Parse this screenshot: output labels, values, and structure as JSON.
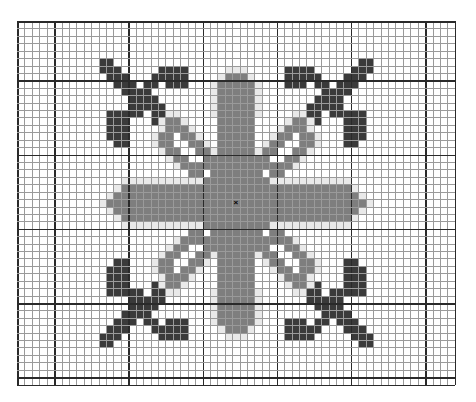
{
  "chart": {
    "cols": 59,
    "rows": 49,
    "cell_px": 7.42,
    "major_every": 10,
    "major_offset_col": 5,
    "major_offset_row": 8,
    "center": {
      "col": 29,
      "row": 24,
      "symbol": "×"
    },
    "colors": {
      "dark": "#3a3a3a",
      "medium": "#7e7e7e",
      "pale": "#e9e9e9",
      "background": "#ffffff",
      "minor_line": "#9a9a9a",
      "major_line": "#2a2a2a"
    },
    "legend": [
      {
        "key": "dark",
        "label": "Dark stitch"
      },
      {
        "key": "medium",
        "label": "Medium stitch"
      },
      {
        "key": "pale",
        "label": "Pale outline stitch"
      }
    ],
    "quadrant_top_left": {
      "dark": [
        [
          5,
          11
        ],
        [
          5,
          12
        ],
        [
          6,
          11
        ],
        [
          6,
          12
        ],
        [
          6,
          13
        ],
        [
          6,
          19
        ],
        [
          6,
          20
        ],
        [
          6,
          21
        ],
        [
          6,
          22
        ],
        [
          7,
          12
        ],
        [
          7,
          13
        ],
        [
          7,
          14
        ],
        [
          7,
          18
        ],
        [
          7,
          19
        ],
        [
          7,
          20
        ],
        [
          7,
          21
        ],
        [
          7,
          22
        ],
        [
          8,
          13
        ],
        [
          8,
          14
        ],
        [
          8,
          15
        ],
        [
          8,
          17
        ],
        [
          8,
          18
        ],
        [
          8,
          20
        ],
        [
          8,
          21
        ],
        [
          8,
          22
        ],
        [
          9,
          14
        ],
        [
          9,
          15
        ],
        [
          9,
          16
        ],
        [
          9,
          17
        ],
        [
          10,
          15
        ],
        [
          10,
          16
        ],
        [
          10,
          17
        ],
        [
          10,
          18
        ],
        [
          11,
          15
        ],
        [
          11,
          16
        ],
        [
          11,
          17
        ],
        [
          11,
          18
        ],
        [
          11,
          19
        ],
        [
          12,
          12
        ],
        [
          12,
          13
        ],
        [
          12,
          14
        ],
        [
          12,
          15
        ],
        [
          12,
          16
        ],
        [
          12,
          18
        ],
        [
          12,
          19
        ],
        [
          13,
          12
        ],
        [
          13,
          13
        ],
        [
          13,
          14
        ],
        [
          13,
          18
        ],
        [
          14,
          12
        ],
        [
          14,
          13
        ],
        [
          14,
          14
        ],
        [
          15,
          12
        ],
        [
          15,
          13
        ],
        [
          15,
          14
        ],
        [
          16,
          13
        ],
        [
          16,
          14
        ]
      ],
      "medium": [
        [
          7,
          28
        ],
        [
          7,
          29
        ],
        [
          8,
          27
        ],
        [
          8,
          28
        ],
        [
          8,
          29
        ],
        [
          9,
          27
        ],
        [
          9,
          28
        ],
        [
          9,
          29
        ],
        [
          10,
          27
        ],
        [
          10,
          28
        ],
        [
          10,
          29
        ],
        [
          11,
          27
        ],
        [
          11,
          28
        ],
        [
          11,
          29
        ],
        [
          12,
          27
        ],
        [
          12,
          28
        ],
        [
          12,
          29
        ],
        [
          13,
          20
        ],
        [
          13,
          21
        ],
        [
          13,
          27
        ],
        [
          13,
          28
        ],
        [
          13,
          29
        ],
        [
          14,
          20
        ],
        [
          14,
          21
        ],
        [
          14,
          22
        ],
        [
          14,
          27
        ],
        [
          14,
          28
        ],
        [
          14,
          29
        ],
        [
          15,
          19
        ],
        [
          15,
          20
        ],
        [
          15,
          22
        ],
        [
          15,
          23
        ],
        [
          15,
          27
        ],
        [
          15,
          28
        ],
        [
          15,
          29
        ],
        [
          16,
          19
        ],
        [
          16,
          20
        ],
        [
          16,
          23
        ],
        [
          16,
          24
        ],
        [
          16,
          27
        ],
        [
          16,
          28
        ],
        [
          16,
          29
        ],
        [
          17,
          20
        ],
        [
          17,
          21
        ],
        [
          17,
          24
        ],
        [
          17,
          25
        ],
        [
          17,
          27
        ],
        [
          17,
          28
        ],
        [
          17,
          29
        ],
        [
          18,
          21
        ],
        [
          18,
          22
        ],
        [
          18,
          25
        ],
        [
          18,
          26
        ],
        [
          18,
          27
        ],
        [
          18,
          28
        ],
        [
          18,
          29
        ],
        [
          19,
          22
        ],
        [
          19,
          23
        ],
        [
          19,
          24
        ],
        [
          19,
          25
        ],
        [
          19,
          26
        ],
        [
          19,
          27
        ],
        [
          19,
          28
        ],
        [
          19,
          29
        ],
        [
          20,
          23
        ],
        [
          20,
          24
        ],
        [
          20,
          26
        ],
        [
          20,
          27
        ],
        [
          20,
          28
        ],
        [
          20,
          29
        ],
        [
          21,
          25
        ],
        [
          21,
          26
        ],
        [
          21,
          27
        ],
        [
          21,
          28
        ],
        [
          21,
          29
        ],
        [
          22,
          14
        ],
        [
          22,
          15
        ],
        [
          22,
          16
        ],
        [
          22,
          17
        ],
        [
          22,
          18
        ],
        [
          22,
          19
        ],
        [
          22,
          20
        ],
        [
          22,
          21
        ],
        [
          22,
          22
        ],
        [
          22,
          23
        ],
        [
          22,
          24
        ],
        [
          22,
          25
        ],
        [
          22,
          26
        ],
        [
          22,
          27
        ],
        [
          22,
          28
        ],
        [
          22,
          29
        ],
        [
          23,
          13
        ],
        [
          23,
          14
        ],
        [
          23,
          15
        ],
        [
          23,
          16
        ],
        [
          23,
          17
        ],
        [
          23,
          18
        ],
        [
          23,
          19
        ],
        [
          23,
          20
        ],
        [
          23,
          21
        ],
        [
          23,
          22
        ],
        [
          23,
          23
        ],
        [
          23,
          24
        ],
        [
          23,
          25
        ],
        [
          23,
          26
        ],
        [
          23,
          27
        ],
        [
          23,
          28
        ],
        [
          23,
          29
        ],
        [
          24,
          12
        ],
        [
          24,
          13
        ],
        [
          24,
          14
        ],
        [
          24,
          15
        ],
        [
          24,
          16
        ],
        [
          24,
          17
        ],
        [
          24,
          18
        ],
        [
          24,
          19
        ],
        [
          24,
          20
        ],
        [
          24,
          21
        ],
        [
          24,
          22
        ],
        [
          24,
          23
        ],
        [
          24,
          24
        ],
        [
          24,
          25
        ],
        [
          24,
          26
        ],
        [
          24,
          27
        ],
        [
          24,
          28
        ],
        [
          24,
          29
        ]
      ],
      "pale": [
        [
          6,
          28
        ],
        [
          6,
          29
        ],
        [
          7,
          27
        ],
        [
          8,
          26
        ],
        [
          9,
          26
        ],
        [
          10,
          26
        ],
        [
          11,
          26
        ],
        [
          12,
          26
        ],
        [
          12,
          20
        ],
        [
          12,
          21
        ],
        [
          13,
          19
        ],
        [
          13,
          22
        ],
        [
          14,
          19
        ],
        [
          14,
          23
        ],
        [
          15,
          18
        ],
        [
          15,
          24
        ],
        [
          16,
          18
        ],
        [
          16,
          25
        ],
        [
          17,
          19
        ],
        [
          17,
          26
        ],
        [
          18,
          20
        ],
        [
          19,
          21
        ],
        [
          21,
          14
        ],
        [
          21,
          15
        ],
        [
          21,
          16
        ],
        [
          21,
          17
        ],
        [
          21,
          18
        ],
        [
          21,
          19
        ],
        [
          21,
          20
        ],
        [
          21,
          21
        ],
        [
          21,
          22
        ],
        [
          21,
          23
        ],
        [
          21,
          24
        ],
        [
          22,
          13
        ],
        [
          23,
          12
        ],
        [
          24,
          11
        ]
      ]
    }
  }
}
